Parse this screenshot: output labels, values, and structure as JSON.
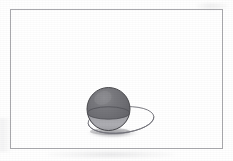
{
  "figure": {
    "caption": "",
    "background_color": "#ffffff",
    "frame": {
      "label": "figure-border",
      "stroke_color": "#a9a9ad",
      "stroke_width": 1,
      "x": 10,
      "y": 9,
      "width": 212,
      "height": 139
    },
    "sphere": {
      "label": "sphere",
      "center_x": 108.5,
      "center_y": 109,
      "radius": 21.5,
      "fill_top_color": "#6e6e72",
      "fill_bottom_color": "#adadb1",
      "outline_color": "#4a4a4e",
      "outline_width": 1,
      "highlight_color": "#8e8e92"
    },
    "equator": {
      "label": "great-circle-equator",
      "center_x": 108.5,
      "center_y": 113,
      "radius_x": 21.0,
      "radius_y": 6.2,
      "stroke_color": "#55555a",
      "stroke_width": 0.9
    },
    "plane_ellipse": {
      "label": "horizontal-plane-ellipse",
      "center_x": 121,
      "center_y": 120,
      "radius_x": 33,
      "radius_y": 13,
      "rotation_deg": -6,
      "stroke_color": "#73737a",
      "stroke_width": 0.9,
      "fill": "none"
    },
    "shadow": {
      "label": "cast-shadow",
      "center_x": 113,
      "center_y": 133,
      "radius_x": 28,
      "radius_y": 6,
      "color": "#8d8d92",
      "opacity": 0.45
    }
  },
  "chart_data": {
    "type": "diagram",
    "elements": [
      "rectangular page frame",
      "shaded sphere",
      "equatorial great circle on sphere",
      "horizontal plane shown as ellipse",
      "soft cast shadow beneath sphere"
    ]
  }
}
